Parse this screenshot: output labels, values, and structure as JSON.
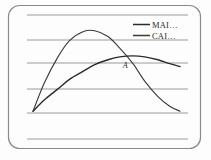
{
  "figure": {
    "name": "two-curve-line-chart",
    "background_color": "#fdfdfd",
    "border_color": "#8a8a8a",
    "gridline_color": "#9a9a9a",
    "annotation_label": "A"
  },
  "legend": {
    "position": "top-right",
    "entries": [
      {
        "label": "MAI…",
        "color": "#2b2b2b",
        "swatch_name": "mai-swatch"
      },
      {
        "label": "CAI…",
        "color": "#3a3a3a",
        "swatch_name": "cai-swatch"
      }
    ]
  },
  "chart_data": {
    "type": "line",
    "title": "",
    "xlabel": "",
    "ylabel": "",
    "grid": true,
    "gridlines_y": [
      15,
      40,
      63,
      89,
      113,
      139
    ],
    "legend_position": "top-right",
    "xlim": [
      0,
      10
    ],
    "ylim": [
      0,
      10
    ],
    "annotations": [
      {
        "text": "A",
        "x": 6.1,
        "y": 5.1
      }
    ],
    "series": [
      {
        "name": "MAI…",
        "color": "#2b2b2b",
        "x": [
          0.0,
          0.8,
          1.7,
          2.5,
          3.4,
          4.2,
          5.1,
          5.9,
          6.8,
          7.6,
          8.5,
          9.3,
          10.0
        ],
        "y": [
          0.6,
          1.8,
          2.9,
          3.9,
          4.7,
          5.4,
          5.9,
          6.2,
          6.3,
          6.2,
          5.9,
          5.5,
          5.2
        ]
      },
      {
        "name": "CAI…",
        "color": "#3a3a3a",
        "x": [
          0.0,
          0.8,
          1.7,
          2.5,
          3.4,
          4.2,
          5.1,
          5.9,
          6.8,
          7.6,
          8.5,
          9.3,
          10.0
        ],
        "y": [
          0.6,
          3.6,
          6.2,
          7.9,
          8.8,
          8.9,
          8.3,
          7.1,
          5.5,
          3.7,
          2.1,
          1.1,
          0.6
        ]
      }
    ]
  }
}
